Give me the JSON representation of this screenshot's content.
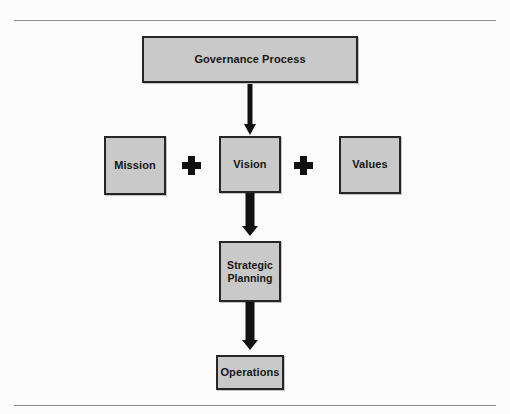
{
  "figure": {
    "background_color": "#fcfcfc",
    "rule_color": "#8d8d8d",
    "box_fill_color": "#c9c9c9",
    "box_border_color": "#262626",
    "connector_color": "#111111"
  },
  "nodes": {
    "governance": {
      "label": "Governance Process"
    },
    "mission": {
      "label": "Mission"
    },
    "vision": {
      "label": "Vision"
    },
    "values": {
      "label": "Values"
    },
    "strategic": {
      "line1": "Strategic",
      "line2": "Planning"
    },
    "operations": {
      "label": "Operations"
    }
  },
  "connectors": {
    "plus_left": {
      "symbol": "+"
    },
    "plus_right": {
      "symbol": "+"
    },
    "arrow_governance_vision": {
      "direction": "down",
      "style": "thin"
    },
    "arrow_vision_strategic": {
      "direction": "down",
      "style": "thick"
    },
    "arrow_strategic_operations": {
      "direction": "down",
      "style": "thick"
    }
  }
}
